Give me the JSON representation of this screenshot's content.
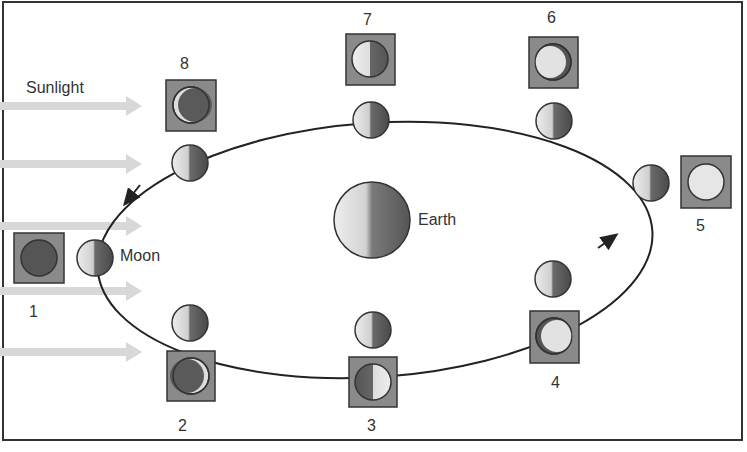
{
  "diagram": {
    "sunlight_label": "Sunlight",
    "earth_label": "Earth",
    "moon_label": "Moon",
    "phases": [
      {
        "number": "1",
        "name": "new moon"
      },
      {
        "number": "2",
        "name": "waxing crescent"
      },
      {
        "number": "3",
        "name": "first quarter"
      },
      {
        "number": "4",
        "name": "waxing gibbous"
      },
      {
        "number": "5",
        "name": "full moon"
      },
      {
        "number": "6",
        "name": "waning gibbous"
      },
      {
        "number": "7",
        "name": "third quarter"
      },
      {
        "number": "8",
        "name": "waning crescent"
      }
    ],
    "colors": {
      "lit": "#e6e6e6",
      "dark": "#555555",
      "box": "#8a8a8a",
      "sun_arrow": "#d8d8d8",
      "orbit": "#222222"
    }
  }
}
